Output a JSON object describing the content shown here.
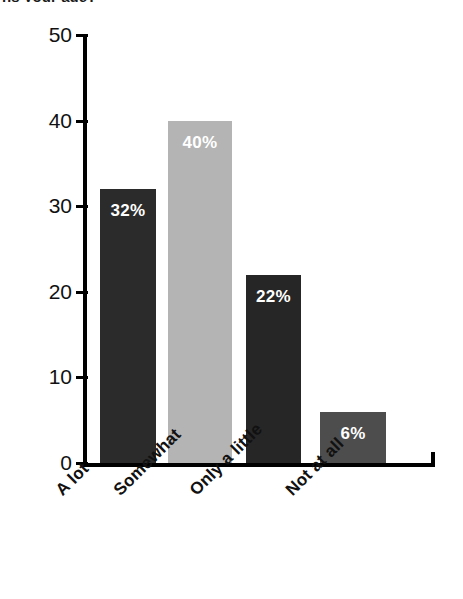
{
  "chart_data": {
    "type": "bar",
    "title": "ns your age?",
    "xlabel": "",
    "ylabel": "",
    "categories": [
      "A lot",
      "Somewhat",
      "Only a little",
      "Not at all"
    ],
    "values": [
      32,
      40,
      22,
      6
    ],
    "data_labels": [
      "32%",
      "40%",
      "22%",
      "6%"
    ],
    "bar_colors": [
      "#2b2b2b",
      "#b4b4b4",
      "#262626",
      "#4d4d4d"
    ],
    "label_colors": [
      "#ffffff",
      "#ffffff",
      "#ffffff",
      "#ffffff"
    ],
    "ylim": [
      0,
      50
    ],
    "yticks": [
      0,
      10,
      20,
      30,
      40,
      50
    ],
    "ytick_labels": [
      "0",
      "10",
      "20",
      "30",
      "40",
      "50"
    ],
    "grid": false,
    "legend": false,
    "legend_position": "none",
    "axis_color": "#000000",
    "background": "#ffffff"
  }
}
